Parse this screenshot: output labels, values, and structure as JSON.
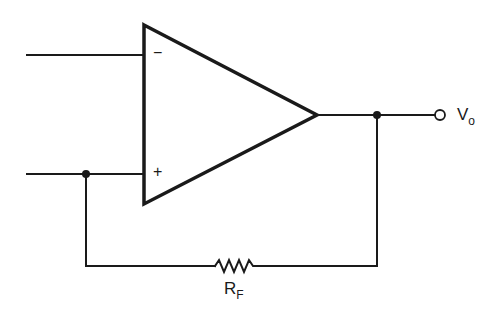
{
  "diagram": {
    "type": "op-amp circuit",
    "colors": {
      "stroke": "#1a1a1a",
      "background": "#ffffff"
    },
    "components": {
      "opamp": {
        "inverting_symbol": "−",
        "noninverting_symbol": "+"
      },
      "resistor": {
        "label_main": "R",
        "label_sub": "F"
      },
      "output_terminal": {
        "label_main": "V",
        "label_sub": "o"
      }
    },
    "wires": [
      {
        "name": "inverting-input-wire",
        "from": [
          27,
          55
        ],
        "to": [
          144,
          55
        ]
      },
      {
        "name": "noninverting-input-wire",
        "from": [
          27,
          174
        ],
        "to": [
          144,
          174
        ]
      },
      {
        "name": "output-wire",
        "from": [
          317,
          115
        ],
        "to": [
          434,
          115
        ]
      },
      {
        "name": "feedback-right-wire",
        "from": [
          377,
          115
        ],
        "to": [
          377,
          266
        ]
      },
      {
        "name": "feedback-bottom-wire",
        "from": [
          86,
          266
        ],
        "to": [
          377,
          266
        ]
      },
      {
        "name": "feedback-left-wire",
        "from": [
          86,
          174
        ],
        "to": [
          86,
          266
        ]
      }
    ],
    "junctions": [
      [
        86,
        174
      ],
      [
        377,
        115
      ]
    ]
  }
}
